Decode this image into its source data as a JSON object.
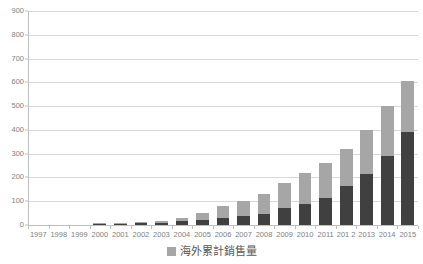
{
  "chart_data": {
    "type": "bar",
    "stacked": true,
    "title": "",
    "subtitle": "",
    "xlabel": "",
    "ylabel": "",
    "ylim": [
      0,
      900
    ],
    "ytick_step": 100,
    "yticks": [
      0,
      100,
      200,
      300,
      400,
      500,
      600,
      700,
      800,
      900
    ],
    "ytick_labels": [
      "0",
      "100",
      "200",
      "300",
      "400",
      "500",
      "600",
      "700",
      "800",
      "900"
    ],
    "grid": true,
    "grid_axis": "y",
    "legend_position": "bottom-center",
    "categories": [
      "1997",
      "1998",
      "1999",
      "2000",
      "2001",
      "2002",
      "2003",
      "2004",
      "2005",
      "2006",
      "2007",
      "2008",
      "2009",
      "2010",
      "2011",
      "201 2",
      "2013",
      "2014",
      "2015"
    ],
    "series": [
      {
        "name": "domestic",
        "color": "#404040",
        "values": [
          0,
          0,
          0,
          5,
          4,
          8,
          10,
          16,
          22,
          28,
          40,
          48,
          70,
          90,
          115,
          165,
          215,
          290,
          390
        ]
      },
      {
        "name": "海外累計銷售量",
        "color": "#a6a6a6",
        "values": [
          0,
          0,
          0,
          2,
          3,
          4,
          6,
          13,
          28,
          52,
          62,
          82,
          105,
          130,
          145,
          155,
          185,
          210,
          215
        ]
      }
    ],
    "totals": [
      0,
      0,
      0,
      7,
      7,
      12,
      16,
      29,
      50,
      80,
      102,
      130,
      175,
      220,
      260,
      320,
      400,
      500,
      605
    ]
  },
  "legend": {
    "label": "海外累計銷售量",
    "swatch_color": "#a6a6a6"
  },
  "colors": {
    "bar_bottom": "#404040",
    "bar_top": "#a6a6a6",
    "gridline": "#d9d9d9",
    "axis": "#bfbfbf",
    "text": "#808080",
    "background": "#ffffff"
  }
}
